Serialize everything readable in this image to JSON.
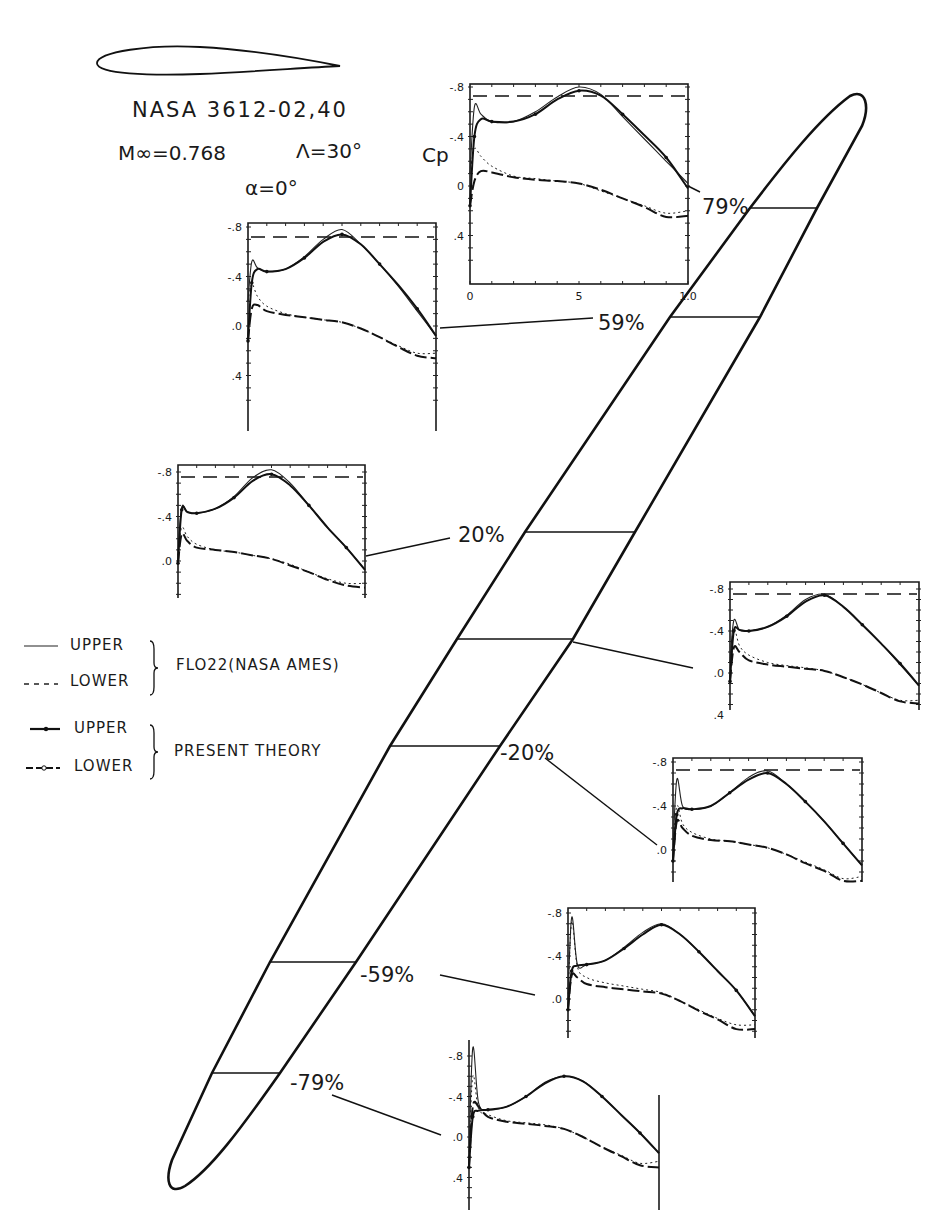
{
  "figure": {
    "airfoil_title": "NASA 3612-02,40",
    "mach": "M∞=0.768",
    "sweep": "Λ=30°",
    "alpha": "α=0°",
    "cp_label": "Cp"
  },
  "legend": {
    "fl_upper": "UPPER",
    "fl_lower": "LOWER",
    "fl_group": "FLO22(NASA AMES)",
    "pt_upper": "UPPER",
    "pt_lower": "LOWER",
    "pt_group": "PRESENT THEORY"
  },
  "stations": {
    "s79": "79%",
    "s59": "59%",
    "s20": "20%",
    "s0": "",
    "sm20": "-20%",
    "sm59": "-59%",
    "sm79": "-79%"
  },
  "x_ticks": [
    "0",
    "5",
    "1.0"
  ],
  "chart_data": {
    "type": "line",
    "title": "NASA 3612-02,40  M∞=0.768  Λ=30°  α=0°",
    "xlabel": "x/c",
    "ylabel": "Cp",
    "x_tick_labels": [
      "0",
      ".5",
      "1.0"
    ],
    "y_tick_labels": [
      "-.8",
      "-.4",
      "0",
      ".4"
    ],
    "ylim": [
      0.4,
      -0.8
    ],
    "critical_cp_dashed_line": -0.74,
    "legend": [
      "UPPER FLO22 (NASA AMES)",
      "LOWER FLO22 (NASA AMES)",
      "UPPER PRESENT THEORY",
      "LOWER PRESENT THEORY"
    ],
    "legend_position": "left-middle",
    "x": [
      0.0,
      0.02,
      0.05,
      0.1,
      0.2,
      0.3,
      0.4,
      0.5,
      0.6,
      0.7,
      0.8,
      0.9,
      1.0
    ],
    "panels": [
      {
        "station": "79%",
        "series": [
          {
            "name": "FLO22 upper",
            "values": [
              -0.1,
              -0.64,
              -0.58,
              -0.52,
              -0.52,
              -0.6,
              -0.72,
              -0.8,
              -0.74,
              -0.56,
              -0.38,
              -0.2,
              -0.02
            ]
          },
          {
            "name": "FLO22 lower",
            "values": [
              -0.1,
              -0.3,
              -0.24,
              -0.16,
              -0.08,
              -0.06,
              -0.04,
              -0.02,
              0.04,
              0.1,
              0.16,
              0.22,
              0.2
            ]
          },
          {
            "name": "Present upper",
            "values": [
              0.16,
              -0.4,
              -0.54,
              -0.52,
              -0.52,
              -0.58,
              -0.7,
              -0.77,
              -0.73,
              -0.58,
              -0.41,
              -0.23,
              0.02
            ]
          },
          {
            "name": "Present lower",
            "values": [
              0.16,
              -0.04,
              -0.12,
              -0.11,
              -0.07,
              -0.05,
              -0.04,
              -0.02,
              0.03,
              0.1,
              0.17,
              0.25,
              0.24
            ]
          }
        ]
      },
      {
        "station": "59%",
        "series": [
          {
            "name": "FLO22 upper",
            "values": [
              -0.2,
              -0.52,
              -0.47,
              -0.44,
              -0.46,
              -0.56,
              -0.7,
              -0.78,
              -0.66,
              -0.5,
              -0.32,
              -0.12,
              0.08
            ]
          },
          {
            "name": "FLO22 lower",
            "values": [
              -0.2,
              -0.34,
              -0.24,
              -0.16,
              -0.1,
              -0.07,
              -0.05,
              -0.03,
              0.02,
              0.09,
              0.16,
              0.22,
              0.22
            ]
          },
          {
            "name": "Present upper",
            "values": [
              0.12,
              -0.35,
              -0.46,
              -0.44,
              -0.46,
              -0.55,
              -0.68,
              -0.74,
              -0.66,
              -0.5,
              -0.33,
              -0.14,
              0.08
            ]
          },
          {
            "name": "Present lower",
            "values": [
              0.12,
              -0.14,
              -0.17,
              -0.12,
              -0.09,
              -0.07,
              -0.05,
              -0.03,
              0.02,
              0.09,
              0.17,
              0.24,
              0.26
            ]
          }
        ]
      },
      {
        "station": "20%",
        "series": [
          {
            "name": "FLO22 upper",
            "values": [
              -0.05,
              -0.48,
              -0.44,
              -0.43,
              -0.47,
              -0.58,
              -0.75,
              -0.82,
              -0.7,
              -0.5,
              -0.3,
              -0.12,
              0.08
            ]
          },
          {
            "name": "FLO22 lower",
            "values": [
              -0.05,
              -0.3,
              -0.22,
              -0.15,
              -0.1,
              -0.08,
              -0.05,
              -0.02,
              0.03,
              0.1,
              0.16,
              0.2,
              0.2
            ]
          },
          {
            "name": "Present upper",
            "values": [
              0.02,
              -0.46,
              -0.44,
              -0.43,
              -0.47,
              -0.57,
              -0.72,
              -0.78,
              -0.68,
              -0.5,
              -0.3,
              -0.12,
              0.08
            ]
          },
          {
            "name": "Present lower",
            "values": [
              0.02,
              -0.24,
              -0.18,
              -0.12,
              -0.1,
              -0.08,
              -0.05,
              -0.02,
              0.04,
              0.1,
              0.17,
              0.22,
              0.24
            ]
          }
        ]
      },
      {
        "station": "0%",
        "series": [
          {
            "name": "FLO22 upper",
            "values": [
              -0.1,
              -0.5,
              -0.41,
              -0.4,
              -0.44,
              -0.55,
              -0.7,
              -0.75,
              -0.63,
              -0.46,
              -0.28,
              -0.08,
              0.12
            ]
          },
          {
            "name": "FLO22 lower",
            "values": [
              -0.1,
              -0.42,
              -0.26,
              -0.17,
              -0.1,
              -0.07,
              -0.05,
              -0.02,
              0.04,
              0.11,
              0.19,
              0.26,
              0.26
            ]
          },
          {
            "name": "Present upper",
            "values": [
              0.08,
              -0.4,
              -0.41,
              -0.4,
              -0.44,
              -0.54,
              -0.68,
              -0.74,
              -0.63,
              -0.46,
              -0.28,
              -0.09,
              0.12
            ]
          },
          {
            "name": "Present lower",
            "values": [
              0.08,
              -0.24,
              -0.2,
              -0.12,
              -0.08,
              -0.06,
              -0.04,
              -0.02,
              0.04,
              0.11,
              0.19,
              0.27,
              0.29
            ]
          }
        ]
      },
      {
        "station": "-20%",
        "series": [
          {
            "name": "FLO22 upper",
            "values": [
              0.0,
              -0.64,
              -0.4,
              -0.37,
              -0.4,
              -0.52,
              -0.66,
              -0.72,
              -0.6,
              -0.44,
              -0.26,
              -0.06,
              0.14
            ]
          },
          {
            "name": "FLO22 lower",
            "values": [
              0.0,
              -0.4,
              -0.24,
              -0.16,
              -0.1,
              -0.08,
              -0.05,
              -0.02,
              0.04,
              0.11,
              0.18,
              0.26,
              0.24
            ]
          },
          {
            "name": "Present upper",
            "values": [
              0.1,
              -0.32,
              -0.38,
              -0.37,
              -0.4,
              -0.52,
              -0.64,
              -0.7,
              -0.6,
              -0.44,
              -0.26,
              -0.06,
              0.14
            ]
          },
          {
            "name": "Present lower",
            "values": [
              0.1,
              -0.26,
              -0.2,
              -0.13,
              -0.09,
              -0.08,
              -0.05,
              -0.02,
              0.04,
              0.12,
              0.19,
              0.28,
              0.28
            ]
          }
        ]
      },
      {
        "station": "-59%",
        "series": [
          {
            "name": "FLO22 upper",
            "values": [
              0.0,
              -0.76,
              -0.32,
              -0.32,
              -0.36,
              -0.48,
              -0.62,
              -0.7,
              -0.6,
              -0.44,
              -0.26,
              -0.08,
              0.16
            ]
          },
          {
            "name": "FLO22 lower",
            "values": [
              0.0,
              -0.72,
              -0.3,
              -0.2,
              -0.15,
              -0.12,
              -0.09,
              -0.06,
              0.02,
              0.1,
              0.18,
              0.24,
              0.24
            ]
          },
          {
            "name": "Present upper",
            "values": [
              0.1,
              -0.26,
              -0.31,
              -0.32,
              -0.36,
              -0.47,
              -0.6,
              -0.69,
              -0.6,
              -0.44,
              -0.26,
              -0.08,
              0.16
            ]
          },
          {
            "name": "Present lower",
            "values": [
              0.1,
              -0.22,
              -0.2,
              -0.14,
              -0.11,
              -0.09,
              -0.07,
              -0.05,
              0.02,
              0.11,
              0.19,
              0.28,
              0.28
            ]
          }
        ]
      },
      {
        "station": "-79%",
        "series": [
          {
            "name": "FLO22 upper",
            "values": [
              0.2,
              -0.88,
              -0.34,
              -0.27,
              -0.3,
              -0.4,
              -0.54,
              -0.6,
              -0.55,
              -0.4,
              -0.22,
              -0.04,
              0.16
            ]
          },
          {
            "name": "FLO22 lower",
            "values": [
              0.2,
              -0.6,
              -0.28,
              -0.22,
              -0.16,
              -0.14,
              -0.12,
              -0.08,
              0.0,
              0.1,
              0.18,
              0.26,
              0.24
            ]
          },
          {
            "name": "Present upper",
            "values": [
              0.3,
              -0.2,
              -0.26,
              -0.27,
              -0.3,
              -0.4,
              -0.53,
              -0.6,
              -0.55,
              -0.4,
              -0.22,
              -0.04,
              0.16
            ]
          },
          {
            "name": "Present lower",
            "values": [
              0.3,
              -0.3,
              -0.3,
              -0.2,
              -0.15,
              -0.13,
              -0.11,
              -0.08,
              0.0,
              0.1,
              0.19,
              0.28,
              0.3
            ]
          }
        ]
      }
    ]
  },
  "layout": {
    "panels": [
      {
        "station_key": "s79",
        "x": 470,
        "y": 84,
        "w": 218,
        "h": 200,
        "y_m08": 87,
        "y_0": 186,
        "tick_labels": [
          "-.8",
          "-.4",
          "0",
          ".4"
        ],
        "frame": "box",
        "xaxis": true,
        "cp": true,
        "dash_y": 96,
        "leader": [
          [
            688,
            186
          ],
          [
            700,
            192
          ]
        ],
        "label_xy": [
          702,
          214
        ]
      },
      {
        "station_key": "s59",
        "x": 248,
        "y": 223,
        "w": 188,
        "h": 208,
        "y_m08": 227,
        "y_0": 326,
        "tick_labels": [
          "-.8",
          "-.4",
          ".0",
          ".4"
        ],
        "frame": "box-open-bottom",
        "dash_y": 237,
        "leader": [
          [
            440,
            328
          ],
          [
            593,
            318
          ]
        ],
        "label_xy": [
          598,
          330
        ]
      },
      {
        "station_key": "s20",
        "x": 178,
        "y": 465,
        "w": 187,
        "h": 133,
        "y_m08": 472,
        "y_0": 561,
        "tick_labels": [
          "-.8",
          "-.4",
          ".0"
        ],
        "frame": "box-open-bottom",
        "dash_y": 477,
        "leader": [
          [
            366,
            556
          ],
          [
            450,
            538
          ]
        ],
        "label_xy": [
          458,
          542
        ]
      },
      {
        "station_key": "s0",
        "x": 730,
        "y": 582,
        "w": 189,
        "h": 128,
        "y_m08": 589,
        "y_0": 673,
        "tick_labels": [
          "-.8",
          "-.4",
          ".0",
          ".4"
        ],
        "frame": "box-open-bottom",
        "dash_y": 594,
        "leader": [
          [
            573,
            642
          ],
          [
            693,
            668
          ]
        ],
        "label_xy": null
      },
      {
        "station_key": "sm20",
        "x": 673,
        "y": 758,
        "w": 189,
        "h": 124,
        "y_m08": 762,
        "y_0": 850,
        "tick_labels": [
          "-.8",
          "-.4",
          ".0"
        ],
        "frame": "box-open-bottom",
        "dash_y": 770,
        "leader": [
          [
            545,
            758
          ],
          [
            657,
            845
          ]
        ],
        "label_xy": [
          500,
          760
        ]
      },
      {
        "station_key": "sm59",
        "x": 568,
        "y": 908,
        "w": 187,
        "h": 130,
        "y_m08": 913,
        "y_0": 999,
        "tick_labels": [
          "-.8",
          "-.4",
          ".0"
        ],
        "frame": "box-open-bottom",
        "dash_y": null,
        "leader": [
          [
            440,
            975
          ],
          [
            535,
            995
          ]
        ],
        "label_xy": [
          360,
          982
        ]
      },
      {
        "station_key": "sm79",
        "x": 469,
        "y": 1040,
        "w": 190,
        "h": 170,
        "y_m08": 1056,
        "y_0": 1137,
        "tick_labels": [
          "-.8",
          "-.4",
          ".0",
          ".4"
        ],
        "frame": "sides-only",
        "dash_y": null,
        "leader": [
          [
            332,
            1095
          ],
          [
            441,
            1135
          ]
        ],
        "label_xy": [
          290,
          1090
        ]
      }
    ],
    "cuts": [
      {
        "y": 208,
        "x1": 750,
        "x2": 817,
        "key": "79"
      },
      {
        "y": 317,
        "x1": 670,
        "x2": 760,
        "key": "59"
      },
      {
        "y": 532,
        "x1": 525,
        "x2": 635,
        "key": "20"
      },
      {
        "y": 639,
        "x1": 457,
        "x2": 573,
        "key": "0"
      },
      {
        "y": 746,
        "x1": 390,
        "x2": 500,
        "key": "-20"
      },
      {
        "y": 962,
        "x1": 270,
        "x2": 356,
        "key": "-59"
      },
      {
        "y": 1073,
        "x1": 212,
        "x2": 280,
        "key": "-79"
      }
    ]
  }
}
